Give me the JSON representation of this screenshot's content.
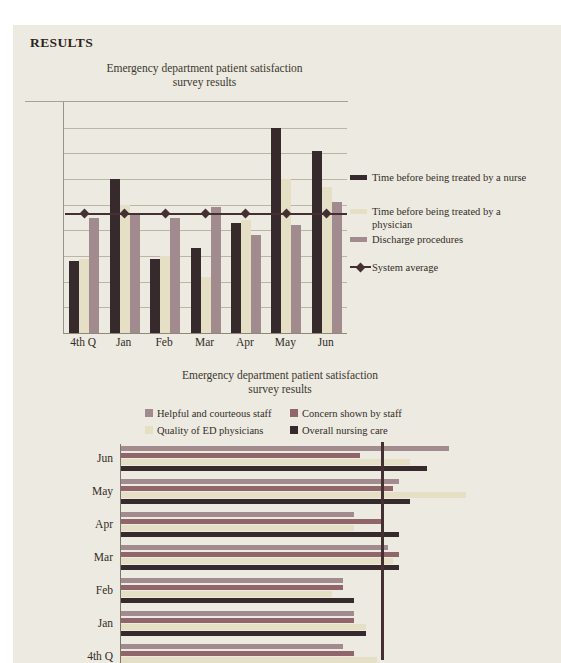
{
  "page": {
    "heading": "RESULTS"
  },
  "colors": {
    "page_bg": "#eceae1",
    "dark_maroon": "#362a2c",
    "cream": "#e5dfc6",
    "rose": "#a18b8e",
    "brick": "#90666a",
    "average_line": "#443033",
    "gridline": "#bcb5a5"
  },
  "chart_data": [
    {
      "type": "bar",
      "orientation": "vertical",
      "title": "Emergency department patient satisfaction survey results",
      "title_lines": [
        "Emergency department patient satisfaction",
        "survey results"
      ],
      "categories": [
        "4th Q",
        "Jan",
        "Feb",
        "Mar",
        "Apr",
        "May",
        "Jun"
      ],
      "series": [
        {
          "name": "Time before being treated by a nurse",
          "color": "#362a2c",
          "values": [
            28,
            60,
            29,
            33,
            43,
            80,
            71
          ]
        },
        {
          "name": "Time before being treated by a physician",
          "color": "#e5dfc6",
          "values": [
            29,
            50,
            30,
            22,
            44,
            60,
            57
          ]
        },
        {
          "name": "Discharge procedures",
          "color": "#a18b8e",
          "values": [
            45,
            46,
            45,
            49,
            38,
            42,
            51
          ]
        }
      ],
      "average_line": {
        "name": "System average",
        "value": 46.5,
        "color": "#443033",
        "marker": "diamond"
      },
      "ylim": [
        0,
        90
      ],
      "gridline_step": 10,
      "grid": "horizontal gridlines, no tick labels",
      "legend_position": "right",
      "note": "y-axis unlabeled; values estimated from gridline spacing"
    },
    {
      "type": "bar",
      "orientation": "horizontal",
      "title": "Emergency department patient satisfaction survey results",
      "title_lines": [
        "Emergency department patient satisfaction",
        "survey results"
      ],
      "categories_top_to_bottom": [
        "Jun",
        "May",
        "Apr",
        "Mar",
        "Feb",
        "Jan",
        "4th Q"
      ],
      "series": [
        {
          "name": "Helpful and courteous staff",
          "color": "#a18b8e",
          "values": [
            59,
            50,
            42,
            48,
            40,
            42,
            40
          ]
        },
        {
          "name": "Concern shown by staff",
          "color": "#90666a",
          "values": [
            43,
            49,
            47,
            50,
            40,
            42,
            42
          ]
        },
        {
          "name": "Quality of ED physicians",
          "color": "#e5dfc6",
          "values": [
            52,
            62,
            42,
            49,
            38,
            44,
            46
          ]
        },
        {
          "name": "Overall nursing care",
          "color": "#362a2c",
          "values": [
            55,
            52,
            50,
            50,
            42,
            44,
            null
          ]
        }
      ],
      "average_line": {
        "value": 47,
        "color": "#443033",
        "style": "vertical-line"
      },
      "xlim": [
        0,
        70
      ],
      "legend_position": "top, two columns",
      "note": "x-axis cut off at image edge; values estimated; last bar of 4th Q group cut off by bottom edge"
    }
  ]
}
